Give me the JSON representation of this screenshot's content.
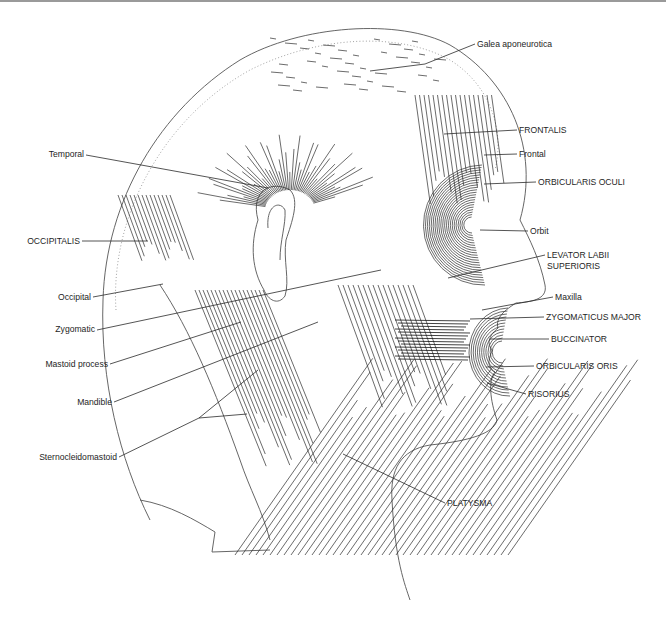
{
  "figure": {
    "colors": {
      "ink": "#1e1e1e",
      "outline": "#555555",
      "background": "#ffffff"
    }
  },
  "labels": [
    {
      "id": "galea-aponeurotica",
      "text": "Galea aponeurotica",
      "x": 477,
      "y": 47,
      "anchor": "start",
      "leader": [
        [
          475,
          44
        ],
        [
          425,
          64
        ],
        [
          370,
          71
        ]
      ]
    },
    {
      "id": "frontalis",
      "text": "FRONTALIS",
      "x": 519,
      "y": 133,
      "anchor": "start",
      "leader": [
        [
          517,
          130
        ],
        [
          444,
          134
        ]
      ]
    },
    {
      "id": "frontal",
      "text": "Frontal",
      "x": 519,
      "y": 157,
      "anchor": "start",
      "leader": [
        [
          517,
          154
        ],
        [
          484,
          155
        ]
      ]
    },
    {
      "id": "orbicularis-oculi",
      "text": "ORBICULARIS  OCULI",
      "x": 538,
      "y": 185,
      "anchor": "start",
      "leader": [
        [
          536,
          182
        ],
        [
          484,
          184
        ]
      ]
    },
    {
      "id": "orbit",
      "text": "Orbit",
      "x": 530,
      "y": 234,
      "anchor": "start",
      "leader": [
        [
          528,
          231
        ],
        [
          480,
          230
        ]
      ]
    },
    {
      "id": "levator-labii-superioris",
      "text": "LEVATOR  LABII",
      "text2": "SUPERIORIS",
      "x": 547,
      "y": 258,
      "anchor": "start",
      "leader": [
        [
          545,
          255
        ],
        [
          448,
          278
        ]
      ]
    },
    {
      "id": "maxilla",
      "text": "Maxilla",
      "x": 555,
      "y": 300,
      "anchor": "start",
      "leader": [
        [
          553,
          297
        ],
        [
          482,
          310
        ]
      ]
    },
    {
      "id": "zygomaticus-major",
      "text": "ZYGOMATICUS  MAJOR",
      "x": 546,
      "y": 320,
      "anchor": "start",
      "leader": [
        [
          544,
          317
        ],
        [
          470,
          319
        ]
      ]
    },
    {
      "id": "buccinator",
      "text": "BUCCINATOR",
      "x": 551,
      "y": 342,
      "anchor": "start",
      "leader": [
        [
          549,
          339
        ],
        [
          490,
          339
        ]
      ]
    },
    {
      "id": "orbicularis-oris",
      "text": "ORBICULARIS  ORIS",
      "x": 536,
      "y": 369,
      "anchor": "start",
      "leader": [
        [
          534,
          366
        ],
        [
          486,
          367
        ]
      ]
    },
    {
      "id": "risorius",
      "text": "RISORIUS",
      "x": 528,
      "y": 397,
      "anchor": "start",
      "leader": [
        [
          526,
          394
        ],
        [
          487,
          383
        ]
      ]
    },
    {
      "id": "platysma",
      "text": "PLATYSMA",
      "x": 447,
      "y": 506,
      "anchor": "start",
      "leader": [
        [
          445,
          503
        ],
        [
          343,
          454
        ]
      ]
    },
    {
      "id": "temporal",
      "text": "Temporal",
      "x": 84,
      "y": 157,
      "anchor": "end",
      "leader": [
        [
          86,
          155
        ],
        [
          268,
          188
        ]
      ]
    },
    {
      "id": "occipitalis",
      "text": "OCCIPITALIS",
      "x": 80,
      "y": 244,
      "anchor": "end",
      "leader": [
        [
          82,
          241
        ],
        [
          148,
          241
        ]
      ]
    },
    {
      "id": "occipital",
      "text": "Occipital",
      "x": 91,
      "y": 300,
      "anchor": "end",
      "leader": [
        [
          93,
          297
        ],
        [
          163,
          284
        ]
      ]
    },
    {
      "id": "zygomatic",
      "text": "Zygomatic",
      "x": 95,
      "y": 332,
      "anchor": "end",
      "leader": [
        [
          97,
          330
        ],
        [
          381,
          270
        ]
      ]
    },
    {
      "id": "mastoid-process",
      "text": "Mastoid process",
      "x": 108,
      "y": 367,
      "anchor": "end",
      "leader": [
        [
          110,
          364
        ],
        [
          241,
          322
        ]
      ]
    },
    {
      "id": "mandible",
      "text": "Mandible",
      "x": 112,
      "y": 405,
      "anchor": "end",
      "leader": [
        [
          114,
          402
        ],
        [
          318,
          322
        ]
      ]
    },
    {
      "id": "sternocleidomastoid",
      "text": "Sternocleidomastoid",
      "x": 117,
      "y": 460,
      "anchor": "end",
      "leader": [
        [
          119,
          457
        ],
        [
          199,
          418
        ],
        [
          258,
          370
        ]
      ],
      "leader2": [
        [
          199,
          418
        ],
        [
          247,
          414
        ]
      ]
    }
  ],
  "art": {
    "head_outline": "M 150 520 C 120 460 100 380 103 300 C 106 200 160 110 240 60 C 300 25 400 18 450 45 C 510 80 540 150 520 220 C 530 240 540 260 545 285 C 548 300 530 302 516 303 C 505 310 495 318 498 328 C 490 335 486 342 492 350 C 490 358 485 365 495 372 C 488 380 490 400 497 420 C 495 430 480 440 430 445 C 400 450 390 470 392 500 C 395 560 405 585 410 600",
    "skull_dotted": "M 116 310 C 110 220 160 120 250 70 C 320 35 400 32 450 60 C 490 85 505 130 495 170",
    "ear": "M 258 220 C 250 190 272 180 290 190 C 300 200 292 222 286 240 C 283 260 290 280 285 296 C 278 306 268 300 264 290 C 252 270 250 245 258 220 Z",
    "ear_inner": "M 268 228 C 266 205 280 200 285 210 C 286 225 280 240 280 260",
    "neck_back": "M 160 285 C 190 330 215 390 240 460 C 250 490 262 510 270 540",
    "shoulder": "M 140 500 C 170 505 195 520 215 532 L 212 552 L 270 550"
  },
  "fiber_groups": [
    {
      "name": "temporalis-fibers",
      "type": "fan",
      "cx": 290,
      "cy": 210,
      "r1": 25,
      "r2": 95,
      "a1": -170,
      "a2": -20,
      "count": 48,
      "style": "fiber"
    },
    {
      "name": "occipitalis-fibers",
      "type": "parallel",
      "x1": 118,
      "y1": 195,
      "x2": 165,
      "y2": 275,
      "dx": 4,
      "count": 14,
      "len": 70,
      "angle": 70,
      "style": "fiber"
    },
    {
      "name": "frontalis-fibers",
      "type": "parallel",
      "x1": 415,
      "y1": 95,
      "dx": 4.5,
      "count": 18,
      "len": 110,
      "angle": 82,
      "style": "fiber"
    },
    {
      "name": "orbicularis-oculi-rings",
      "type": "rings",
      "cx": 470,
      "cy": 225,
      "rx_min": 8,
      "rx_max": 60,
      "ry_ratio": 1.0,
      "count": 22,
      "style": "fiber"
    },
    {
      "name": "masseter-fibers",
      "type": "parallel",
      "x1": 338,
      "y1": 285,
      "dx": 5,
      "count": 16,
      "len": 130,
      "angle": 70,
      "style": "fiber"
    },
    {
      "name": "buccinator-fibers",
      "type": "horizontal",
      "x1": 395,
      "y1": 320,
      "x2": 470,
      "count": 14,
      "gap": 3,
      "style": "fiber-dark"
    },
    {
      "name": "orbicularis-oris-rings",
      "type": "rings",
      "cx": 500,
      "cy": 352,
      "rx_min": 10,
      "rx_max": 40,
      "ry_ratio": 1.1,
      "count": 12,
      "style": "fiber"
    },
    {
      "name": "sternocleidomastoid-fibers",
      "type": "parallel",
      "x1": 195,
      "y1": 290,
      "dx": 4,
      "count": 18,
      "len": 190,
      "angle": 68,
      "style": "fiber"
    },
    {
      "name": "platysma-fibers",
      "type": "parallel",
      "x1": 235,
      "y1": 555,
      "dx": 7,
      "count": 40,
      "len": 240,
      "angle": -55,
      "style": "fiber"
    }
  ]
}
